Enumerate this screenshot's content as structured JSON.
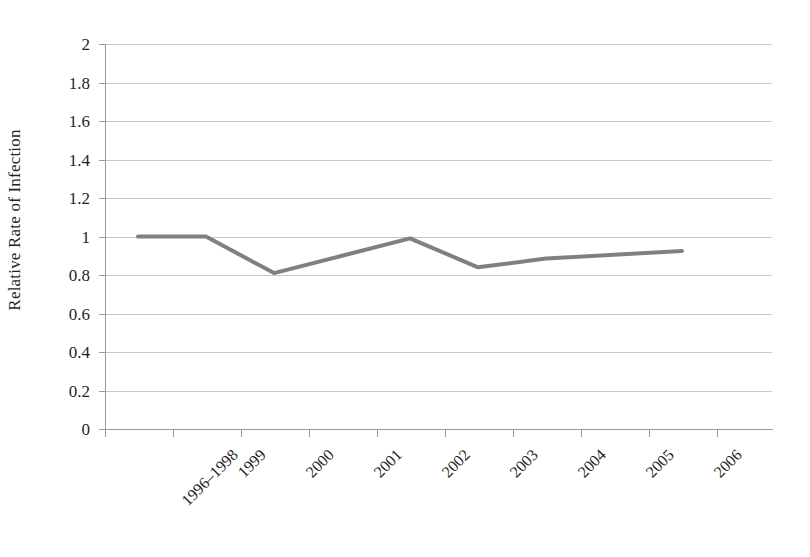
{
  "chart_data": {
    "type": "line",
    "title": "",
    "subtitle": "",
    "xlabel": "",
    "ylabel": "Relative Rate of Infection",
    "categories": [
      "1996–1998",
      "1999",
      "2000",
      "2001",
      "2002",
      "2003",
      "2004",
      "2005",
      "2006"
    ],
    "series": [
      {
        "name": "Relative Rate of Infection",
        "color": "#808080",
        "values": [
          1.0,
          1.0,
          0.81,
          0.9,
          0.99,
          0.84,
          0.885,
          0.905,
          0.925
        ]
      }
    ],
    "ylim": [
      0,
      2
    ],
    "yticks": [
      0,
      0.2,
      0.4,
      0.6,
      0.8,
      1.0,
      1.2,
      1.4,
      1.6,
      1.8,
      2.0
    ],
    "ytick_labels": [
      "0",
      "0.2",
      "0.4",
      "0.6",
      "0.8",
      "1",
      "1.2",
      "1.4",
      "1.6",
      "1.8",
      "2"
    ],
    "grid": true,
    "grid_color": "#c8c8c8",
    "legend": false,
    "legend_position": "none",
    "background": "#ffffff",
    "axis_color": "#9a9a9a"
  },
  "axis": {
    "y_title": "Relative Rate of Infection",
    "y_labels": {
      "t0": "0",
      "t1": "0.2",
      "t2": "0.4",
      "t3": "0.6",
      "t4": "0.8",
      "t5": "1",
      "t6": "1.2",
      "t7": "1.4",
      "t8": "1.6",
      "t9": "1.8",
      "t10": "2"
    },
    "x_labels": {
      "c0": "1996–1998",
      "c1": "1999",
      "c2": "2000",
      "c3": "2001",
      "c4": "2002",
      "c5": "2003",
      "c6": "2004",
      "c7": "2005",
      "c8": "2006"
    }
  }
}
